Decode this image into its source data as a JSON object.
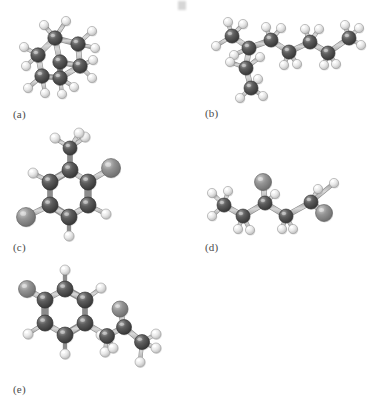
{
  "figure": {
    "style": "grayscale ball-and-stick",
    "background_color": "#ffffff",
    "panel_count": 5
  },
  "atom_colors": {
    "carbon": "#4d4d4d",
    "carbon_highlight": "#8f8f8f",
    "hydrogen": "#e8e8e8",
    "hydrogen_highlight": "#ffffff",
    "heteroatom": "#7d7d7d",
    "heteroatom_highlight": "#bdbdbd",
    "bond": "#b3b3b3",
    "bond_edge": "#8c8c8c",
    "label_color": "#4a4a4a"
  },
  "panels": [
    {
      "id": "a",
      "label": "(a)",
      "label_x": 13,
      "label_y": 108,
      "description": "bicyclic saturated hydrocarbon, fused ring cage",
      "atoms": [
        {
          "el": "C",
          "x": 55,
          "y": 38,
          "r": 7.2
        },
        {
          "el": "C",
          "x": 78,
          "y": 44,
          "r": 7.2
        },
        {
          "el": "C",
          "x": 38,
          "y": 55,
          "r": 7.2
        },
        {
          "el": "C",
          "x": 60,
          "y": 62,
          "r": 7.2
        },
        {
          "el": "C",
          "x": 80,
          "y": 66,
          "r": 7.2
        },
        {
          "el": "C",
          "x": 42,
          "y": 76,
          "r": 7.2
        },
        {
          "el": "C",
          "x": 60,
          "y": 78,
          "r": 7.2
        },
        {
          "el": "H",
          "x": 66,
          "y": 21,
          "r": 4.6
        },
        {
          "el": "H",
          "x": 44,
          "y": 25,
          "r": 4.6
        },
        {
          "el": "H",
          "x": 92,
          "y": 31,
          "r": 4.6
        },
        {
          "el": "H",
          "x": 95,
          "y": 48,
          "r": 4.6
        },
        {
          "el": "H",
          "x": 24,
          "y": 47,
          "r": 4.6
        },
        {
          "el": "H",
          "x": 26,
          "y": 66,
          "r": 4.6
        },
        {
          "el": "H",
          "x": 93,
          "y": 60,
          "r": 4.6
        },
        {
          "el": "H",
          "x": 92,
          "y": 78,
          "r": 4.6
        },
        {
          "el": "H",
          "x": 28,
          "y": 88,
          "r": 4.6
        },
        {
          "el": "H",
          "x": 45,
          "y": 93,
          "r": 4.6
        },
        {
          "el": "H",
          "x": 62,
          "y": 94,
          "r": 4.6
        },
        {
          "el": "H",
          "x": 74,
          "y": 87,
          "r": 4.6
        }
      ],
      "bonds": [
        [
          0,
          1
        ],
        [
          0,
          2
        ],
        [
          0,
          3
        ],
        [
          1,
          4
        ],
        [
          2,
          5
        ],
        [
          3,
          4
        ],
        [
          3,
          6
        ],
        [
          5,
          6
        ],
        [
          4,
          6
        ],
        [
          0,
          7
        ],
        [
          0,
          8
        ],
        [
          1,
          9
        ],
        [
          1,
          10
        ],
        [
          2,
          11
        ],
        [
          2,
          12
        ],
        [
          4,
          13
        ],
        [
          4,
          14
        ],
        [
          5,
          15
        ],
        [
          5,
          16
        ],
        [
          6,
          17
        ],
        [
          6,
          18
        ]
      ]
    },
    {
      "id": "b",
      "label": "(b)",
      "label_x": 205,
      "label_y": 107,
      "description": "branched alkane chain with two methyl branches",
      "atoms": [
        {
          "el": "C",
          "x": 232,
          "y": 36,
          "r": 7.0
        },
        {
          "el": "C",
          "x": 249,
          "y": 48,
          "r": 7.0
        },
        {
          "el": "C",
          "x": 246,
          "y": 68,
          "r": 7.0
        },
        {
          "el": "C",
          "x": 251,
          "y": 88,
          "r": 7.0
        },
        {
          "el": "C",
          "x": 271,
          "y": 40,
          "r": 7.0
        },
        {
          "el": "C",
          "x": 289,
          "y": 52,
          "r": 7.0
        },
        {
          "el": "C",
          "x": 310,
          "y": 42,
          "r": 7.0
        },
        {
          "el": "C",
          "x": 328,
          "y": 53,
          "r": 7.0
        },
        {
          "el": "C",
          "x": 349,
          "y": 38,
          "r": 7.0
        },
        {
          "el": "H",
          "x": 216,
          "y": 46,
          "r": 4.6
        },
        {
          "el": "H",
          "x": 228,
          "y": 22,
          "r": 4.6
        },
        {
          "el": "H",
          "x": 243,
          "y": 24,
          "r": 4.6
        },
        {
          "el": "H",
          "x": 234,
          "y": 55,
          "r": 4.6
        },
        {
          "el": "H",
          "x": 260,
          "y": 57,
          "r": 4.6
        },
        {
          "el": "H",
          "x": 230,
          "y": 62,
          "r": 4.6
        },
        {
          "el": "H",
          "x": 240,
          "y": 98,
          "r": 4.6
        },
        {
          "el": "H",
          "x": 263,
          "y": 96,
          "r": 4.6
        },
        {
          "el": "H",
          "x": 258,
          "y": 79,
          "r": 4.6
        },
        {
          "el": "H",
          "x": 266,
          "y": 27,
          "r": 4.6
        },
        {
          "el": "H",
          "x": 281,
          "y": 28,
          "r": 4.6
        },
        {
          "el": "H",
          "x": 284,
          "y": 65,
          "r": 4.6
        },
        {
          "el": "H",
          "x": 297,
          "y": 64,
          "r": 4.6
        },
        {
          "el": "H",
          "x": 305,
          "y": 29,
          "r": 4.6
        },
        {
          "el": "H",
          "x": 319,
          "y": 29,
          "r": 4.6
        },
        {
          "el": "H",
          "x": 324,
          "y": 65,
          "r": 4.6
        },
        {
          "el": "H",
          "x": 336,
          "y": 64,
          "r": 4.6
        },
        {
          "el": "H",
          "x": 345,
          "y": 25,
          "r": 4.6
        },
        {
          "el": "H",
          "x": 361,
          "y": 45,
          "r": 4.6
        },
        {
          "el": "H",
          "x": 359,
          "y": 28,
          "r": 4.6
        }
      ],
      "bonds": [
        [
          1,
          0
        ],
        [
          1,
          2
        ],
        [
          1,
          4
        ],
        [
          2,
          3
        ],
        [
          4,
          5
        ],
        [
          5,
          6
        ],
        [
          6,
          7
        ],
        [
          7,
          8
        ],
        [
          0,
          9
        ],
        [
          0,
          10
        ],
        [
          0,
          11
        ],
        [
          1,
          12
        ],
        [
          2,
          13
        ],
        [
          2,
          14
        ],
        [
          3,
          15
        ],
        [
          3,
          16
        ],
        [
          3,
          17
        ],
        [
          4,
          18
        ],
        [
          4,
          19
        ],
        [
          5,
          20
        ],
        [
          5,
          21
        ],
        [
          6,
          22
        ],
        [
          6,
          23
        ],
        [
          7,
          24
        ],
        [
          7,
          25
        ],
        [
          8,
          26
        ],
        [
          8,
          27
        ],
        [
          8,
          28
        ]
      ]
    },
    {
      "id": "c",
      "label": "(c)",
      "label_x": 13,
      "label_y": 241,
      "description": "disubstituted methylbenzene ring with two halogen atoms",
      "atoms": [
        {
          "el": "C",
          "x": 70,
          "y": 170,
          "r": 8.0
        },
        {
          "el": "C",
          "x": 50,
          "y": 182,
          "r": 8.0
        },
        {
          "el": "C",
          "x": 88,
          "y": 182,
          "r": 8.0
        },
        {
          "el": "C",
          "x": 50,
          "y": 205,
          "r": 8.0
        },
        {
          "el": "C",
          "x": 88,
          "y": 205,
          "r": 8.0
        },
        {
          "el": "C",
          "x": 69,
          "y": 217,
          "r": 8.0
        },
        {
          "el": "C",
          "x": 70,
          "y": 148,
          "r": 7.0
        },
        {
          "el": "X",
          "x": 111,
          "y": 168,
          "r": 9.5
        },
        {
          "el": "X",
          "x": 26,
          "y": 217,
          "r": 9.5
        },
        {
          "el": "H",
          "x": 33,
          "y": 173,
          "r": 5.0
        },
        {
          "el": "H",
          "x": 106,
          "y": 214,
          "r": 5.0
        },
        {
          "el": "H",
          "x": 69,
          "y": 236,
          "r": 5.0
        },
        {
          "el": "H",
          "x": 55,
          "y": 138,
          "r": 5.0
        },
        {
          "el": "H",
          "x": 85,
          "y": 137,
          "r": 5.0
        },
        {
          "el": "H",
          "x": 79,
          "y": 133,
          "r": 5.0
        }
      ],
      "bonds": [
        [
          0,
          1
        ],
        [
          0,
          2
        ],
        [
          1,
          3
        ],
        [
          2,
          4
        ],
        [
          3,
          5
        ],
        [
          4,
          5
        ],
        [
          0,
          6
        ],
        [
          2,
          7
        ],
        [
          3,
          8
        ],
        [
          1,
          9
        ],
        [
          4,
          10
        ],
        [
          5,
          11
        ],
        [
          6,
          12
        ],
        [
          6,
          13
        ],
        [
          6,
          14
        ]
      ],
      "double_bonds": [
        [
          0,
          1
        ],
        [
          2,
          4
        ],
        [
          3,
          5
        ]
      ]
    },
    {
      "id": "d",
      "label": "(d)",
      "label_x": 205,
      "label_y": 241,
      "description": "open chain with two heteroatom substituents",
      "atoms": [
        {
          "el": "C",
          "x": 224,
          "y": 205,
          "r": 7.0
        },
        {
          "el": "C",
          "x": 243,
          "y": 216,
          "r": 7.0
        },
        {
          "el": "C",
          "x": 265,
          "y": 203,
          "r": 7.0
        },
        {
          "el": "C",
          "x": 286,
          "y": 216,
          "r": 7.0
        },
        {
          "el": "C",
          "x": 311,
          "y": 202,
          "r": 7.0
        },
        {
          "el": "X",
          "x": 263,
          "y": 182,
          "r": 8.5
        },
        {
          "el": "X",
          "x": 324,
          "y": 213,
          "r": 8.5
        },
        {
          "el": "H",
          "x": 212,
          "y": 193,
          "r": 4.6
        },
        {
          "el": "H",
          "x": 228,
          "y": 191,
          "r": 4.6
        },
        {
          "el": "H",
          "x": 212,
          "y": 216,
          "r": 4.6
        },
        {
          "el": "H",
          "x": 238,
          "y": 229,
          "r": 4.6
        },
        {
          "el": "H",
          "x": 250,
          "y": 230,
          "r": 4.6
        },
        {
          "el": "H",
          "x": 275,
          "y": 194,
          "r": 4.6
        },
        {
          "el": "H",
          "x": 282,
          "y": 229,
          "r": 4.6
        },
        {
          "el": "H",
          "x": 293,
          "y": 229,
          "r": 4.6
        },
        {
          "el": "H",
          "x": 318,
          "y": 189,
          "r": 4.6
        },
        {
          "el": "H",
          "x": 334,
          "y": 183,
          "r": 4.6
        }
      ],
      "bonds": [
        [
          0,
          1
        ],
        [
          1,
          2
        ],
        [
          2,
          3
        ],
        [
          3,
          4
        ],
        [
          2,
          5
        ],
        [
          4,
          6
        ],
        [
          0,
          7
        ],
        [
          0,
          8
        ],
        [
          0,
          9
        ],
        [
          1,
          10
        ],
        [
          1,
          11
        ],
        [
          2,
          12
        ],
        [
          3,
          13
        ],
        [
          3,
          14
        ],
        [
          4,
          15
        ],
        [
          4,
          16
        ]
      ]
    },
    {
      "id": "e",
      "label": "(e)",
      "label_x": 13,
      "label_y": 383,
      "description": "substituted benzene ring bearing a side chain with carbonyl group",
      "atoms": [
        {
          "el": "C",
          "x": 45,
          "y": 300,
          "r": 8.0
        },
        {
          "el": "C",
          "x": 65,
          "y": 289,
          "r": 8.0
        },
        {
          "el": "C",
          "x": 85,
          "y": 300,
          "r": 8.0
        },
        {
          "el": "C",
          "x": 45,
          "y": 323,
          "r": 8.0
        },
        {
          "el": "C",
          "x": 85,
          "y": 323,
          "r": 8.0
        },
        {
          "el": "C",
          "x": 65,
          "y": 335,
          "r": 8.0
        },
        {
          "el": "X",
          "x": 27,
          "y": 289,
          "r": 8.5
        },
        {
          "el": "C",
          "x": 107,
          "y": 336,
          "r": 7.5
        },
        {
          "el": "C",
          "x": 124,
          "y": 327,
          "r": 7.5
        },
        {
          "el": "X",
          "x": 120,
          "y": 309,
          "r": 8.0
        },
        {
          "el": "C",
          "x": 142,
          "y": 342,
          "r": 7.5
        },
        {
          "el": "H",
          "x": 65,
          "y": 270,
          "r": 5.0
        },
        {
          "el": "H",
          "x": 101,
          "y": 288,
          "r": 5.0
        },
        {
          "el": "H",
          "x": 28,
          "y": 334,
          "r": 5.0
        },
        {
          "el": "H",
          "x": 65,
          "y": 354,
          "r": 5.0
        },
        {
          "el": "H",
          "x": 101,
          "y": 335,
          "r": 5.0
        },
        {
          "el": "H",
          "x": 105,
          "y": 352,
          "r": 5.0
        },
        {
          "el": "H",
          "x": 113,
          "y": 348,
          "r": 5.0
        },
        {
          "el": "H",
          "x": 156,
          "y": 334,
          "r": 5.0
        },
        {
          "el": "H",
          "x": 156,
          "y": 348,
          "r": 5.0
        },
        {
          "el": "H",
          "x": 140,
          "y": 362,
          "r": 5.0
        }
      ],
      "bonds": [
        [
          0,
          1
        ],
        [
          1,
          2
        ],
        [
          0,
          3
        ],
        [
          2,
          4
        ],
        [
          3,
          5
        ],
        [
          4,
          5
        ],
        [
          0,
          6
        ],
        [
          4,
          7
        ],
        [
          7,
          8
        ],
        [
          8,
          9
        ],
        [
          8,
          10
        ],
        [
          1,
          11
        ],
        [
          2,
          12
        ],
        [
          3,
          13
        ],
        [
          5,
          14
        ],
        [
          7,
          16
        ],
        [
          7,
          17
        ],
        [
          10,
          18
        ],
        [
          10,
          19
        ],
        [
          10,
          20
        ]
      ],
      "double_bonds": [
        [
          1,
          2
        ],
        [
          0,
          3
        ],
        [
          4,
          5
        ]
      ]
    }
  ]
}
